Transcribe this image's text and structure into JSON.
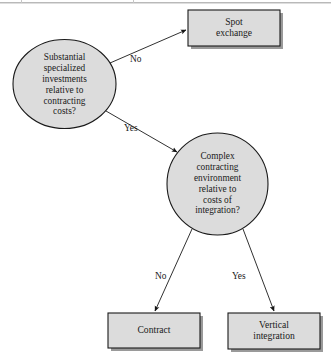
{
  "figure": {
    "background_color": "#ffffff",
    "shape_fill": "#dcdcdc",
    "shape_stroke": "#1a1a1a",
    "shadow_color": "#9a9a9a"
  },
  "nodes": [
    {
      "id": "substantial-investments",
      "shape": "ellipse",
      "label": "Substantial\nspecialized\ninvestments\nrelative to\ncontracting\ncosts?"
    },
    {
      "id": "spot-exchange",
      "shape": "rect",
      "label": "Spot\nexchange"
    },
    {
      "id": "complex-contracting",
      "shape": "ellipse",
      "label": "Complex\ncontracting\nenvironment\nrelative to\ncosts of\nintegration?"
    },
    {
      "id": "contract",
      "shape": "rect",
      "label": "Contract"
    },
    {
      "id": "vertical-integration",
      "shape": "rect",
      "label": "Vertical\nintegration"
    }
  ],
  "edges": [
    {
      "id": "investments-to-spot-exchange",
      "from": "substantial-investments",
      "to": "spot-exchange",
      "label": "No"
    },
    {
      "id": "investments-to-complex-contracting",
      "from": "substantial-investments",
      "to": "complex-contracting",
      "label": "Yes"
    },
    {
      "id": "complex-contracting-to-contract",
      "from": "complex-contracting",
      "to": "contract",
      "label": "No"
    },
    {
      "id": "complex-contracting-to-vertical-integration",
      "from": "complex-contracting",
      "to": "vertical-integration",
      "label": "Yes"
    }
  ]
}
